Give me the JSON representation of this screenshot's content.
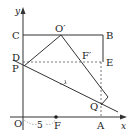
{
  "diagram": {
    "type": "geometry-coordinate-figure",
    "axes": {
      "x_label": "x",
      "y_label": "y",
      "origin_label": "O"
    },
    "points": {
      "C": "C",
      "B": "B",
      "O_prime": "O′",
      "D": "D",
      "P": "P",
      "E": "E",
      "F_prime": "F′",
      "Q": "Q",
      "A": "A",
      "F": "F"
    },
    "measure_label": "5",
    "colors": {
      "stroke": "#333333",
      "text": "#222222",
      "background": "#ffffff"
    }
  }
}
